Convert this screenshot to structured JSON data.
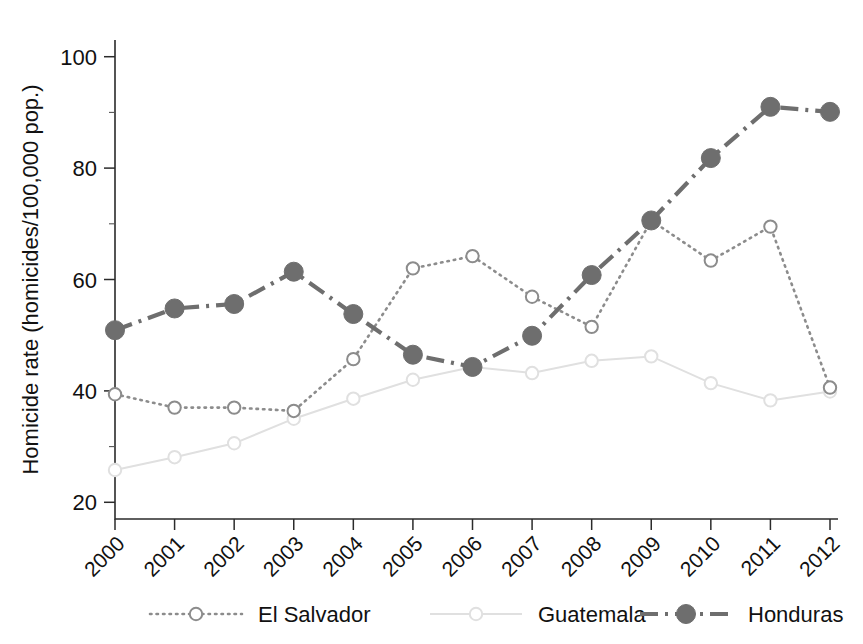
{
  "chart_data": {
    "type": "line",
    "title": "",
    "xlabel": "",
    "ylabel": "Homicide rate (homicides/100,000 pop.)",
    "x": [
      2000,
      2001,
      2002,
      2003,
      2004,
      2005,
      2006,
      2007,
      2008,
      2009,
      2010,
      2011,
      2012
    ],
    "categories": [
      "2000",
      "2001",
      "2002",
      "2003",
      "2004",
      "2005",
      "2006",
      "2007",
      "2008",
      "2009",
      "2010",
      "2011",
      "2012"
    ],
    "xlim": [
      2000,
      2012
    ],
    "ylim": [
      17,
      103
    ],
    "yticks": [
      20,
      40,
      60,
      80,
      100
    ],
    "ytick_labels": [
      "20",
      "40",
      "60",
      "80",
      "100"
    ],
    "grid": false,
    "legend_position": "bottom",
    "series": [
      {
        "name": "El Salvador",
        "marker": "open-circle",
        "linestyle": "dotted",
        "color": "#8c8c8c",
        "values": [
          39.4,
          37.0,
          37.0,
          36.4,
          45.7,
          62.0,
          64.2,
          56.9,
          51.5,
          70.6,
          63.4,
          69.5,
          40.6
        ]
      },
      {
        "name": "Guatemala",
        "marker": "open-circle",
        "linestyle": "solid",
        "color": "#e0e0e0",
        "values": [
          25.8,
          28.1,
          30.6,
          35.0,
          38.6,
          42.0,
          44.3,
          43.2,
          45.4,
          46.2,
          41.4,
          38.3,
          39.9
        ]
      },
      {
        "name": "Honduras",
        "marker": "filled-circle",
        "linestyle": "dashdot",
        "color": "#6e6e6e",
        "values": [
          50.9,
          54.8,
          55.6,
          61.4,
          53.8,
          46.5,
          44.3,
          49.9,
          60.8,
          70.6,
          81.8,
          91.0,
          90.1
        ]
      }
    ],
    "legend": [
      {
        "label": "El Salvador",
        "marker": "open-circle",
        "linestyle": "dotted",
        "color": "#8c8c8c"
      },
      {
        "label": "Guatemala",
        "marker": "open-circle",
        "linestyle": "solid",
        "color": "#e0e0e0"
      },
      {
        "label": "Honduras",
        "marker": "filled-circle",
        "linestyle": "dashdot",
        "color": "#6e6e6e"
      }
    ]
  },
  "colors": {
    "background": "#ffffff",
    "axis": "#2b2b2b",
    "text": "#111111",
    "el_salvador": "#8c8c8c",
    "guatemala": "#e0e0e0",
    "honduras": "#6e6e6e"
  }
}
